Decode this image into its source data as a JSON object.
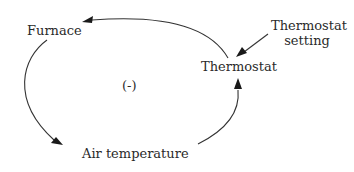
{
  "diagram": {
    "type": "causal-loop",
    "loop_polarity": "(-)",
    "nodes": [
      {
        "id": "furnace",
        "label": "Furnace"
      },
      {
        "id": "thermostat",
        "label": "Thermostat"
      },
      {
        "id": "thermostat_setting",
        "label_line1": "Thermostat",
        "label_line2": "setting"
      },
      {
        "id": "air_temperature",
        "label": "Air temperature"
      }
    ],
    "edges": [
      {
        "from": "thermostat",
        "to": "furnace"
      },
      {
        "from": "furnace",
        "to": "air_temperature"
      },
      {
        "from": "air_temperature",
        "to": "thermostat"
      },
      {
        "from": "thermostat_setting",
        "to": "thermostat"
      }
    ],
    "colors": {
      "line": "#333333",
      "text": "#2a2a2a",
      "background": "#ffffff"
    }
  }
}
